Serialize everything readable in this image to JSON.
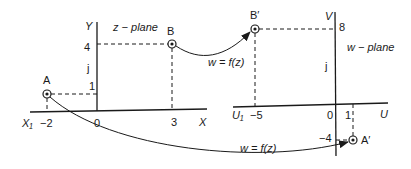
{
  "z_plane": {
    "title": "z − plane",
    "y_axis_label": "Y",
    "x_axis_label": "X",
    "j_label": "j",
    "x_ticks": {
      "x1_label": "X₁",
      "neg2": "−2",
      "zero": "0",
      "three": "3"
    },
    "y_ticks": {
      "four": "4",
      "one": "1"
    },
    "points": {
      "A": {
        "label": "A",
        "x": -2,
        "y": 1
      },
      "B": {
        "label": "B",
        "x": 3,
        "y": 4
      }
    }
  },
  "w_plane": {
    "title": "w − plane",
    "v_axis_label": "V",
    "u_axis_label": "U",
    "j_label": "j",
    "u_ticks": {
      "u1_label": "U₁",
      "neg5": "−5",
      "zero": "0",
      "one": "1"
    },
    "v_ticks": {
      "eight": "8",
      "neg4": "−4"
    },
    "points": {
      "B_prime": {
        "label": "B′",
        "u": -5,
        "v": 8
      },
      "A_prime": {
        "label": "A′",
        "u": 1,
        "v": -4
      }
    }
  },
  "mappings": {
    "upper": {
      "label": "w = f(z)",
      "from": "B",
      "to": "B′"
    },
    "lower": {
      "label": "w = f(z)",
      "from": "A",
      "to": "A′"
    }
  },
  "colors": {
    "ink": "#1a1a1a",
    "background": "#ffffff"
  }
}
